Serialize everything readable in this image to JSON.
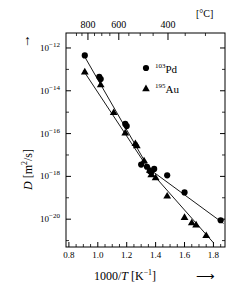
{
  "figure": {
    "kind": "arrhenius-plot",
    "background": "#ffffff",
    "ink": "#000000"
  },
  "axes": {
    "x_bottom": {
      "title_main": "1000/",
      "title_var": "T",
      "title_unit": "[K",
      "title_unit_exp": "−1",
      "title_unit_close": "]",
      "arrow": "⟶",
      "ticks": [
        "0.8",
        "1.0",
        "1.2",
        "1.4",
        "1.6",
        "1.8"
      ],
      "tick_values": [
        0.8,
        1.0,
        1.2,
        1.4,
        1.6,
        1.8
      ],
      "min": 0.78,
      "max": 1.88,
      "minor_per_major": 4
    },
    "x_top": {
      "unit": "[°C]",
      "ticks": [
        "800",
        "600",
        "400"
      ],
      "tick_values_celsius": [
        800,
        600,
        400
      ],
      "minor_tick_values_celsius": [
        900,
        800,
        700,
        600,
        500,
        400,
        300
      ]
    },
    "y_left": {
      "title_var": "D",
      "title_unit_open": "[m",
      "title_unit_exp": "2",
      "title_unit_rest": "/s]",
      "arrow": "↑",
      "ticks": [
        "10−12",
        "10−14",
        "10−16",
        "10−18",
        "10−20"
      ],
      "tick_exponents": [
        -12,
        -14,
        -16,
        -18,
        -20
      ],
      "tick_mantissa": "10",
      "min_exponent": -21.3,
      "max_exponent": -11.3
    }
  },
  "legend": {
    "entries": [
      {
        "marker": "circle",
        "isotope": "103",
        "element": "Pd"
      },
      {
        "marker": "triangle",
        "isotope": "195",
        "element": "Au"
      }
    ]
  },
  "chart_data": {
    "type": "scatter",
    "title": "",
    "xlabel": "1000/T [K⁻¹]",
    "ylabel": "D [m²/s]",
    "yscale": "log10",
    "xlim": [
      0.78,
      1.88
    ],
    "ylim_log10": [
      -21.3,
      -11.3
    ],
    "grid": false,
    "legend_position": "top-right",
    "series": [
      {
        "name": "103Pd",
        "marker": "circle",
        "x": [
          0.91,
          1.01,
          1.02,
          1.19,
          1.2,
          1.3,
          1.34,
          1.36,
          1.37,
          1.39,
          1.48,
          1.6,
          1.85
        ],
        "log10_y": [
          -12.35,
          -13.35,
          -13.45,
          -15.55,
          -15.65,
          -17.45,
          -17.55,
          -17.75,
          -17.8,
          -17.65,
          -17.95,
          -18.75,
          -20.05
        ],
        "fit_line": {
          "breakpoint_x": 1.355,
          "segment1": {
            "x": [
              0.9,
              1.355
            ],
            "log10_y": [
              -12.3,
              -17.65
            ]
          },
          "segment2": {
            "x": [
              1.355,
              1.87
            ],
            "log10_y": [
              -17.65,
              -20.2
            ]
          }
        }
      },
      {
        "name": "195Au",
        "marker": "triangle",
        "x": [
          0.91,
          1.02,
          1.11,
          1.19,
          1.26,
          1.27,
          1.32,
          1.36,
          1.37,
          1.4,
          1.48,
          1.6,
          1.65,
          1.68,
          1.75
        ],
        "log10_y": [
          -13.1,
          -13.7,
          -15.0,
          -15.95,
          -16.45,
          -16.55,
          -17.25,
          -17.7,
          -17.9,
          -18.05,
          -18.9,
          -19.9,
          -20.15,
          -20.25,
          -20.75
        ],
        "fit_line": {
          "breakpoint_x": 1.355,
          "segment1": {
            "x": [
              0.9,
              1.355
            ],
            "log10_y": [
              -13.05,
              -17.7
            ]
          },
          "segment2": {
            "x": [
              1.355,
              1.8
            ],
            "log10_y": [
              -17.7,
              -21.1
            ]
          }
        }
      }
    ]
  }
}
